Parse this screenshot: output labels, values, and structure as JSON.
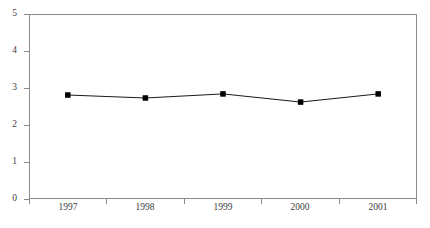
{
  "chart_data": {
    "type": "line",
    "title": "",
    "subtitle": "",
    "xlabel": "",
    "ylabel": "",
    "categories": [
      "1997",
      "1998",
      "1999",
      "2000",
      "2001"
    ],
    "series": [
      {
        "name": "",
        "values": [
          2.81,
          2.73,
          2.84,
          2.62,
          2.84
        ]
      }
    ],
    "ylim": [
      0,
      5
    ],
    "y_ticks": [
      "0",
      "1",
      "2",
      "3",
      "4",
      "5"
    ],
    "y_tick_values": [
      0,
      1,
      2,
      3,
      4,
      5
    ],
    "x_ticks": [
      "1997",
      "1998",
      "1999",
      "2000",
      "2001"
    ],
    "grid": false,
    "legend": false,
    "legend_position": "none",
    "marker": "square",
    "annotations": []
  },
  "style": {
    "line_color": "#1a1a1a",
    "marker_color": "#000000",
    "frame_color": "#8a8a8a",
    "tick_label_color": "#3d3d3d",
    "background_color": "#ffffff"
  },
  "axis": {
    "y_label_0": "0",
    "y_label_1": "1",
    "y_label_2": "2",
    "y_label_3": "3",
    "y_label_4": "4",
    "y_label_5": "5",
    "x_label_0": "1997",
    "x_label_1": "1998",
    "x_label_2": "1999",
    "x_label_3": "2000",
    "x_label_4": "2001"
  }
}
